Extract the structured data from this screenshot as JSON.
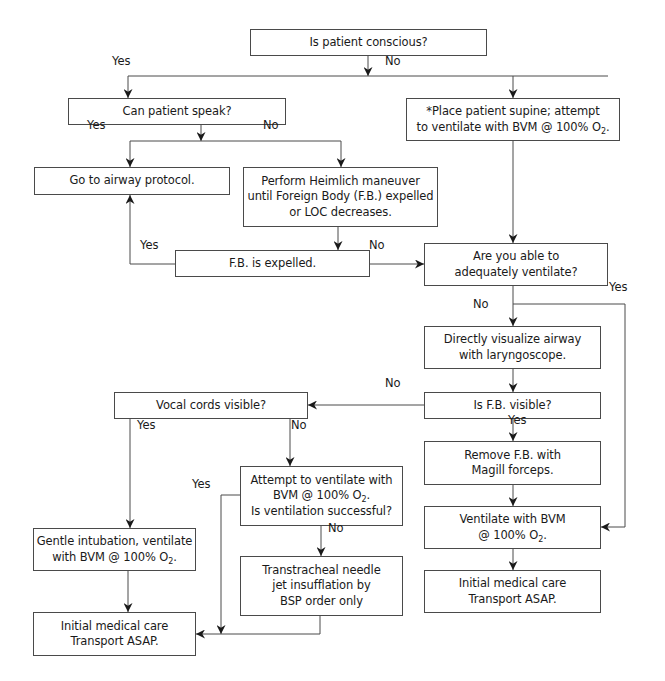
{
  "diagram": {
    "type": "flowchart",
    "nodes": [
      {
        "id": "conscious",
        "lines": [
          "Is patient conscious?"
        ],
        "box": [
          250,
          29,
          237,
          27
        ]
      },
      {
        "id": "speak",
        "lines": [
          "Can patient speak?"
        ],
        "box": [
          68,
          98,
          218,
          27
        ]
      },
      {
        "id": "supine",
        "lines": [
          "*Place patient supine; attempt",
          "to ventilate with BVM @ 100% O",
          "2",
          "."
        ],
        "box": [
          406,
          98,
          214,
          43
        ],
        "o2_line": 1
      },
      {
        "id": "airway_protocol",
        "lines": [
          "Go to airway protocol."
        ],
        "box": [
          34,
          167,
          196,
          28
        ]
      },
      {
        "id": "heimlich",
        "lines": [
          "Perform Heimlich maneuver",
          "until Foreign Body (F.B.) expelled",
          "or LOC decreases."
        ],
        "box": [
          243,
          167,
          195,
          60
        ]
      },
      {
        "id": "fb_expelled",
        "lines": [
          "F.B. is expelled."
        ],
        "box": [
          175,
          250,
          195,
          27
        ]
      },
      {
        "id": "adequately",
        "lines": [
          "Are you able to",
          "adequately ventilate?"
        ],
        "box": [
          424,
          243,
          184,
          43
        ]
      },
      {
        "id": "visualize",
        "lines": [
          "Directly visualize airway",
          "with laryngoscope."
        ],
        "box": [
          424,
          326,
          177,
          43
        ]
      },
      {
        "id": "fb_visible",
        "lines": [
          "Is F.B. visible?"
        ],
        "box": [
          424,
          392,
          177,
          27
        ]
      },
      {
        "id": "vocal",
        "lines": [
          "Vocal cords visible?"
        ],
        "box": [
          114,
          392,
          194,
          27
        ]
      },
      {
        "id": "remove",
        "lines": [
          "Remove F.B. with",
          "Magill forceps."
        ],
        "box": [
          424,
          441,
          177,
          44
        ]
      },
      {
        "id": "attempt",
        "lines": [
          "Attempt to ventilate with",
          "BVM @ 100% O",
          "2",
          ".",
          "Is ventilation successful?"
        ],
        "box": [
          240,
          466,
          163,
          60
        ],
        "o2_line": 1
      },
      {
        "id": "ventilate_right",
        "lines": [
          "Ventilate with BVM",
          "@ 100% O",
          "2",
          "."
        ],
        "box": [
          424,
          506,
          177,
          43
        ],
        "o2_line": 1
      },
      {
        "id": "gentle",
        "lines": [
          "Gentle intubation, ventilate",
          "with BVM @ 100% O",
          "2",
          "."
        ],
        "box": [
          33,
          528,
          163,
          43
        ],
        "o2_line": 1
      },
      {
        "id": "transtracheal",
        "lines": [
          "Transtracheal needle",
          "jet insufflation by",
          "BSP order only"
        ],
        "box": [
          240,
          556,
          163,
          60
        ]
      },
      {
        "id": "initial_right",
        "lines": [
          "Initial medical care",
          "Transport ASAP."
        ],
        "box": [
          424,
          570,
          177,
          43
        ]
      },
      {
        "id": "initial_left",
        "lines": [
          "Initial medical care",
          "Transport ASAP."
        ],
        "box": [
          33,
          612,
          163,
          44
        ]
      }
    ],
    "edge_labels": [
      {
        "text": "Yes",
        "pos": [
          120,
          64
        ]
      },
      {
        "text": "No",
        "pos": [
          393,
          64
        ]
      },
      {
        "text": "Yes",
        "pos": [
          95,
          128
        ]
      },
      {
        "text": "No",
        "pos": [
          271,
          128
        ]
      },
      {
        "text": "Yes",
        "pos": [
          148,
          248
        ]
      },
      {
        "text": "No",
        "pos": [
          377,
          248
        ]
      },
      {
        "text": "Yes",
        "pos": [
          617,
          290
        ]
      },
      {
        "text": "No",
        "pos": [
          481,
          307
        ]
      },
      {
        "text": "No",
        "pos": [
          393,
          386
        ]
      },
      {
        "text": "Yes",
        "pos": [
          516,
          423
        ]
      },
      {
        "text": "Yes",
        "pos": [
          145,
          428
        ]
      },
      {
        "text": "No",
        "pos": [
          299,
          428
        ]
      },
      {
        "text": "Yes",
        "pos": [
          200,
          487
        ]
      },
      {
        "text": "No",
        "pos": [
          336,
          531
        ]
      }
    ],
    "edges": [
      {
        "from": "conscious",
        "to": "branch",
        "path": [
          [
            368,
            56
          ],
          [
            368,
            76
          ]
        ],
        "arrow": true
      },
      {
        "from": "branch",
        "to": "speak",
        "path": [
          [
            128,
            76
          ],
          [
            608,
            76
          ]
        ],
        "arrow": false
      },
      {
        "from": "branch",
        "to": "speak",
        "path": [
          [
            128,
            76
          ],
          [
            128,
            98
          ]
        ],
        "arrow": true
      },
      {
        "from": "branch",
        "to": "supine",
        "path": [
          [
            513,
            76
          ],
          [
            513,
            98
          ]
        ],
        "arrow": true
      },
      {
        "from": "speak",
        "to": "speak_branch",
        "path": [
          [
            201,
            125
          ],
          [
            201,
            141
          ]
        ],
        "arrow": true
      },
      {
        "from": "speak_branch",
        "to": "",
        "path": [
          [
            130,
            141
          ],
          [
            341,
            141
          ]
        ],
        "arrow": false
      },
      {
        "from": "speak_branch",
        "to": "airway_protocol",
        "path": [
          [
            130,
            141
          ],
          [
            130,
            167
          ]
        ],
        "arrow": true
      },
      {
        "from": "speak_branch",
        "to": "heimlich",
        "path": [
          [
            341,
            141
          ],
          [
            341,
            167
          ]
        ],
        "arrow": true
      },
      {
        "from": "supine",
        "to": "adequately",
        "path": [
          [
            513,
            141
          ],
          [
            513,
            243
          ]
        ],
        "arrow": true
      },
      {
        "from": "heimlich",
        "to": "fb_expelled",
        "path": [
          [
            338,
            227
          ],
          [
            338,
            250
          ]
        ],
        "arrow": true
      },
      {
        "from": "fb_expelled",
        "to": "airway_protocol",
        "path": [
          [
            175,
            264
          ],
          [
            130,
            264
          ],
          [
            130,
            195
          ]
        ],
        "arrow": true
      },
      {
        "from": "fb_expelled",
        "to": "adequately",
        "path": [
          [
            370,
            264
          ],
          [
            424,
            264
          ]
        ],
        "arrow": true
      },
      {
        "from": "adequately",
        "to": "visualize",
        "path": [
          [
            513,
            286
          ],
          [
            513,
            326
          ]
        ],
        "arrow": true
      },
      {
        "from": "adequately",
        "to": "ventilate_right",
        "path": [
          [
            513,
            304
          ],
          [
            625,
            304
          ],
          [
            625,
            527
          ],
          [
            601,
            527
          ]
        ],
        "arrow": true
      },
      {
        "from": "visualize",
        "to": "fb_visible",
        "path": [
          [
            513,
            369
          ],
          [
            513,
            392
          ]
        ],
        "arrow": true
      },
      {
        "from": "fb_visible",
        "to": "vocal",
        "path": [
          [
            424,
            405
          ],
          [
            308,
            405
          ]
        ],
        "arrow": true
      },
      {
        "from": "fb_visible",
        "to": "remove",
        "path": [
          [
            513,
            419
          ],
          [
            513,
            441
          ]
        ],
        "arrow": true
      },
      {
        "from": "remove",
        "to": "ventilate_right",
        "path": [
          [
            513,
            485
          ],
          [
            513,
            506
          ]
        ],
        "arrow": true
      },
      {
        "from": "ventilate_right",
        "to": "initial_right",
        "path": [
          [
            513,
            549
          ],
          [
            513,
            570
          ]
        ],
        "arrow": true
      },
      {
        "from": "vocal",
        "to": "gentle",
        "path": [
          [
            130,
            419
          ],
          [
            130,
            528
          ]
        ],
        "arrow": true
      },
      {
        "from": "vocal",
        "to": "attempt",
        "path": [
          [
            290,
            419
          ],
          [
            290,
            466
          ]
        ],
        "arrow": true
      },
      {
        "from": "attempt",
        "to": "initial_left",
        "path": [
          [
            240,
            495
          ],
          [
            221,
            495
          ],
          [
            221,
            634
          ]
        ],
        "arrow": true
      },
      {
        "from": "attempt",
        "to": "transtracheal",
        "path": [
          [
            321,
            526
          ],
          [
            321,
            556
          ]
        ],
        "arrow": true
      },
      {
        "from": "transtracheal",
        "to": "initial_left",
        "path": [
          [
            320,
            616
          ],
          [
            320,
            634
          ],
          [
            196,
            634
          ]
        ],
        "arrow": true
      },
      {
        "from": "gentle",
        "to": "initial_left",
        "path": [
          [
            128,
            571
          ],
          [
            128,
            612
          ]
        ],
        "arrow": true
      }
    ]
  }
}
